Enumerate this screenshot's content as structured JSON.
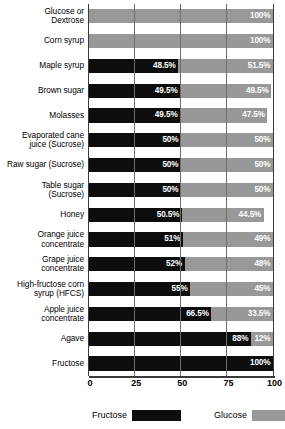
{
  "chart_data": {
    "type": "bar",
    "orientation": "horizontal",
    "stacked": true,
    "title": "",
    "subtitle": "",
    "xlabel": "",
    "ylabel": "",
    "xlim": [
      0,
      100
    ],
    "xticks": [
      0,
      25,
      50,
      75,
      100
    ],
    "xtick_labels": [
      "0",
      "25",
      "50",
      "75",
      "100"
    ],
    "grid": true,
    "legend_position": "bottom",
    "categories": [
      "Glucose or\nDextrose",
      "Corn syrup",
      "Maple syrup",
      "Brown sugar",
      "Molasses",
      "Evaporated cane\njuice (Sucrose)",
      "Raw sugar (Sucrose)",
      "Table sugar\n(Sucrose)",
      "Honey",
      "Orange juice\nconcentrate",
      "Grape juice\nconcentrate",
      "High-fructose corn\nsyrup (HFCS)",
      "Apple juice\nconcentrate",
      "Agave",
      "Fructose"
    ],
    "series": [
      {
        "name": "Fructose",
        "color": "#0d0d0d",
        "values": [
          0,
          0,
          48.5,
          49.5,
          49.5,
          50,
          50,
          50,
          50.5,
          51,
          52,
          55,
          66.5,
          88,
          100
        ],
        "labels": [
          "",
          "",
          "48.5%",
          "49.5%",
          "49.5%",
          "50%",
          "50%",
          "50%",
          "50.5%",
          "51%",
          "52%",
          "55%",
          "66.5%",
          "88%",
          "100%"
        ]
      },
      {
        "name": "Glucose",
        "color": "#989898",
        "values": [
          100,
          100,
          51.5,
          49.5,
          47.5,
          50,
          50,
          50,
          44.5,
          49,
          48,
          45,
          33.5,
          12,
          0
        ],
        "labels": [
          "100%",
          "100%",
          "51.5%",
          "49.5%",
          "47.5%",
          "50%",
          "50%",
          "50%",
          "44.5%",
          "49%",
          "48%",
          "45%",
          "33.5%",
          "12%",
          ""
        ]
      }
    ],
    "legend": [
      {
        "label": "Fructose",
        "color": "#0d0d0d"
      },
      {
        "label": "Glucose",
        "color": "#989898"
      }
    ]
  },
  "colors": {
    "fructose": "#0d0d0d",
    "glucose": "#989898",
    "gridline": "#6e6e6e",
    "axis": "#3a3a3a",
    "background": "#ffffff"
  }
}
